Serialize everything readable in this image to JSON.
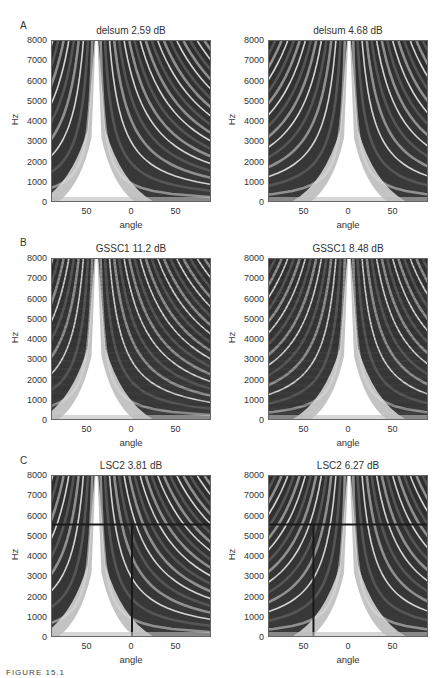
{
  "figure": {
    "caption": "FIGURE 15.1"
  },
  "panels": [
    {
      "letter": "A"
    },
    {
      "letter": "B"
    },
    {
      "letter": "C"
    }
  ],
  "axes": {
    "xlabel": "angle",
    "ylabel": "Hz",
    "yticks": [
      "8000",
      "7000",
      "6000",
      "5000",
      "4000",
      "3000",
      "2000",
      "1000",
      "0"
    ],
    "xticks": [
      "50",
      "0",
      "50"
    ]
  },
  "chart_data": [
    {
      "type": "heatmap",
      "panel": "A",
      "position": "left",
      "title": "delsum 2.59 dB",
      "xlabel": "angle",
      "ylabel": "Hz",
      "ylim": [
        0,
        8000
      ],
      "xlim": [
        -90,
        90
      ],
      "xticks": [
        "50",
        "0",
        "50"
      ],
      "yticks": [
        0,
        1000,
        2000,
        3000,
        4000,
        5000,
        6000,
        7000,
        8000
      ],
      "colormap": "gray",
      "steer_angle": -40,
      "description": "Delay-and-sum beampattern steered ~-40 deg; bright main lobe widening at low frequency, curved sidelobe bands"
    },
    {
      "type": "heatmap",
      "panel": "A",
      "position": "right",
      "title": "delsum 4.68 dB",
      "xlabel": "angle",
      "ylabel": "Hz",
      "ylim": [
        0,
        8000
      ],
      "xlim": [
        -90,
        90
      ],
      "xticks": [
        "50",
        "0",
        "50"
      ],
      "yticks": [
        0,
        1000,
        2000,
        3000,
        4000,
        5000,
        6000,
        7000,
        8000
      ],
      "colormap": "gray",
      "steer_angle": 0,
      "description": "Delay-and-sum beampattern steered at 0 deg; symmetric curved sidelobe bands"
    },
    {
      "type": "heatmap",
      "panel": "B",
      "position": "left",
      "title": "GSSC1 11.2 dB",
      "xlabel": "angle",
      "ylabel": "Hz",
      "ylim": [
        0,
        8000
      ],
      "xlim": [
        -90,
        90
      ],
      "xticks": [
        "50",
        "0",
        "50"
      ],
      "yticks": [
        0,
        1000,
        2000,
        3000,
        4000,
        5000,
        6000,
        7000,
        8000
      ],
      "colormap": "gray",
      "steer_angle": -40,
      "description": "GSSC1 beampattern steered ~-40 deg; noisy fragmented sidelobe structure"
    },
    {
      "type": "heatmap",
      "panel": "B",
      "position": "right",
      "title": "GSSC1 8.48 dB",
      "xlabel": "angle",
      "ylabel": "Hz",
      "ylim": [
        0,
        8000
      ],
      "xlim": [
        -90,
        90
      ],
      "xticks": [
        "50",
        "0",
        "50"
      ],
      "yticks": [
        0,
        1000,
        2000,
        3000,
        4000,
        5000,
        6000,
        7000,
        8000
      ],
      "colormap": "gray",
      "steer_angle": 0,
      "description": "GSSC1 beampattern steered at 0 deg"
    },
    {
      "type": "heatmap",
      "panel": "C",
      "position": "left",
      "title": "LSC2 3.81 dB",
      "xlabel": "angle",
      "ylabel": "Hz",
      "ylim": [
        0,
        8000
      ],
      "xlim": [
        -90,
        90
      ],
      "xticks": [
        "50",
        "0",
        "50"
      ],
      "yticks": [
        0,
        1000,
        2000,
        3000,
        4000,
        5000,
        6000,
        7000,
        8000
      ],
      "colormap": "gray",
      "steer_angle": -40,
      "description": "LSC2 beampattern steered ~-40 deg; horizontal dark line near 5600 Hz, null near 0 deg"
    },
    {
      "type": "heatmap",
      "panel": "C",
      "position": "right",
      "title": "LSC2 6.27 dB",
      "xlabel": "angle",
      "ylabel": "Hz",
      "ylim": [
        0,
        8000
      ],
      "xlim": [
        -90,
        90
      ],
      "xticks": [
        "50",
        "0",
        "50"
      ],
      "yticks": [
        0,
        1000,
        2000,
        3000,
        4000,
        5000,
        6000,
        7000,
        8000
      ],
      "colormap": "gray",
      "steer_angle": 0,
      "description": "LSC2 beampattern steered at 0 deg; horizontal dark line near 5600 Hz, null near -40 deg"
    }
  ]
}
